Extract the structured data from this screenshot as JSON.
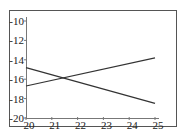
{
  "chart_data": {
    "type": "line",
    "title": "",
    "xlabel": "",
    "ylabel": "",
    "xlim": [
      20,
      25
    ],
    "ylim": [
      -20,
      -10
    ],
    "x_ticks": [
      20,
      21,
      22,
      23,
      24,
      25
    ],
    "y_ticks": [
      -10,
      -12,
      -14,
      -16,
      -18,
      -20
    ],
    "x_tick_labels": [
      "20",
      "21",
      "22",
      "23",
      "24",
      "25"
    ],
    "y_tick_labels": [
      "-10",
      "-12",
      "-14",
      "-16",
      "-18",
      "-20"
    ],
    "grid": false,
    "legend": null,
    "series": [
      {
        "name": "line-1",
        "x": [
          20,
          25
        ],
        "y": [
          -14.8,
          -18.5
        ],
        "color": "#333333"
      },
      {
        "name": "line-2",
        "x": [
          20,
          25
        ],
        "y": [
          -16.7,
          -13.8
        ],
        "color": "#333333"
      }
    ]
  },
  "colors": {
    "frame": "#555555",
    "axis": "#777777",
    "line": "#333333",
    "text": "#222222"
  }
}
